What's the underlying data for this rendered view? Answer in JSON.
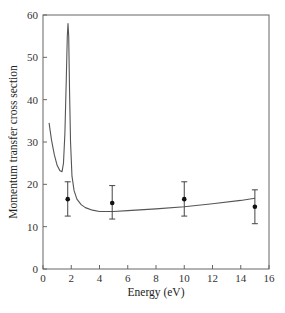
{
  "chart_data": {
    "type": "line",
    "title": "",
    "xlabel": "Energy (eV)",
    "ylabel": "Momentum transfer cross section",
    "xlim": [
      0,
      16
    ],
    "ylim": [
      0,
      60
    ],
    "xticks": [
      0,
      2,
      4,
      6,
      8,
      10,
      12,
      14,
      16
    ],
    "yticks": [
      0,
      10,
      20,
      30,
      40,
      50,
      60
    ],
    "grid": false,
    "legend": null,
    "series": [
      {
        "name": "theory curve",
        "kind": "line",
        "x": [
          0.43,
          0.6,
          0.8,
          1.0,
          1.2,
          1.35,
          1.45,
          1.55,
          1.65,
          1.72,
          1.77,
          1.82,
          1.88,
          1.95,
          2.05,
          2.2,
          2.4,
          2.7,
          3.0,
          3.5,
          4.0,
          5.0,
          6.0,
          8.0,
          10.0,
          12.0,
          14.0,
          15.0
        ],
        "y": [
          34.5,
          30.5,
          27.0,
          24.5,
          23.2,
          23.0,
          25.0,
          32.0,
          45.0,
          55.0,
          58.0,
          55.0,
          42.0,
          30.0,
          22.0,
          18.5,
          16.5,
          15.2,
          14.5,
          13.9,
          13.6,
          13.6,
          13.8,
          14.2,
          14.7,
          15.4,
          16.2,
          16.7
        ]
      },
      {
        "name": "measured points",
        "kind": "scatter_errorbar",
        "x": [
          1.75,
          4.9,
          10.0,
          15.0
        ],
        "y": [
          16.5,
          15.6,
          16.5,
          14.7
        ],
        "err_low": [
          12.5,
          11.8,
          12.5,
          10.7
        ],
        "err_high": [
          20.6,
          19.7,
          20.6,
          18.7
        ]
      }
    ]
  },
  "plot": {
    "left": 43,
    "right": 269,
    "top": 15,
    "bottom": 269,
    "line_color": "#555555",
    "frame_color": "#666666",
    "marker_color": "#111111"
  }
}
